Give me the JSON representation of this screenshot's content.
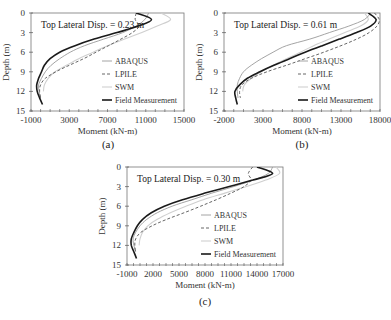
{
  "chart_data": [
    {
      "id": "a",
      "type": "line",
      "caption": "(a)",
      "title": "",
      "annotation": "Top Lateral Disp. = 0.23 m",
      "xlabel": "Moment (kN-m)",
      "ylabel": "Depth (m)",
      "xlim": [
        -1000,
        15000
      ],
      "ylim": [
        0,
        15
      ],
      "y_inverted": true,
      "xticks": [
        -1000,
        3000,
        7000,
        11000,
        15000
      ],
      "xtick_labels": [
        "-1000",
        "3000",
        "7000",
        "11000",
        "15000"
      ],
      "yticks": [
        0,
        3,
        6,
        9,
        12,
        15
      ],
      "yticks_labels": [
        "0",
        "3",
        "6",
        "9",
        "12",
        "15"
      ],
      "grid": false,
      "legend_position": "lower right",
      "series": [
        {
          "name": "ABAQUS",
          "style": "thin-gray",
          "depth": [
            0,
            1,
            2,
            3,
            4,
            5,
            6,
            7,
            8,
            9,
            10,
            11,
            12,
            13
          ],
          "moment": [
            11300,
            10900,
            10000,
            8600,
            6600,
            4600,
            3100,
            2000,
            1100,
            500,
            100,
            -200,
            -150,
            0
          ]
        },
        {
          "name": "LPILE",
          "style": "dashed",
          "depth": [
            0,
            1,
            2,
            3,
            4,
            5,
            6,
            7,
            8,
            9,
            10,
            11,
            12,
            13
          ],
          "moment": [
            10000,
            9900,
            10300,
            9600,
            8400,
            7100,
            5800,
            4500,
            3000,
            1600,
            500,
            0,
            -100,
            0
          ]
        },
        {
          "name": "SWM",
          "style": "light-gray",
          "depth": [
            0,
            1,
            2,
            3,
            4,
            5,
            6,
            7,
            8,
            9,
            10,
            11,
            12
          ],
          "moment": [
            12600,
            13600,
            12200,
            10600,
            8800,
            7000,
            5500,
            4000,
            2700,
            1500,
            800,
            400,
            300
          ]
        },
        {
          "name": "Field Measurement",
          "style": "thick-black",
          "depth": [
            0,
            1,
            2,
            3,
            4,
            5,
            6,
            7,
            8,
            9,
            10,
            11,
            12,
            13,
            14
          ],
          "moment": [
            10000,
            11600,
            10200,
            8000,
            5600,
            3600,
            2000,
            1000,
            400,
            100,
            -200,
            -400,
            -350,
            -100,
            200
          ]
        }
      ]
    },
    {
      "id": "b",
      "type": "line",
      "caption": "(b)",
      "title": "",
      "annotation": "Top Lateral Disp. = 0.61 m",
      "xlabel": "Moment (kN-m)",
      "ylabel": "Depth (m)",
      "xlim": [
        -2000,
        18000
      ],
      "ylim": [
        0,
        15
      ],
      "y_inverted": true,
      "xticks": [
        -2000,
        3000,
        8000,
        13000,
        18000
      ],
      "xtick_labels": [
        "-2000",
        "3000",
        "8000",
        "13000",
        "18000"
      ],
      "yticks": [
        0,
        3,
        6,
        9,
        12,
        15
      ],
      "yticks_labels": [
        "0",
        "3",
        "6",
        "9",
        "12",
        "15"
      ],
      "grid": false,
      "legend_position": "lower right",
      "series": [
        {
          "name": "ABAQUS",
          "style": "thin-gray",
          "depth": [
            0,
            1,
            2,
            3,
            4,
            5,
            6,
            7,
            8,
            9,
            10,
            11,
            12,
            13
          ],
          "moment": [
            16800,
            16000,
            14000,
            11500,
            9000,
            6000,
            4300,
            2800,
            1500,
            500,
            0,
            -300,
            -300,
            -200
          ]
        },
        {
          "name": "LPILE",
          "style": "dashed",
          "depth": [
            0,
            1,
            2,
            3,
            4,
            5,
            6,
            7,
            8,
            9,
            10,
            11,
            12,
            13
          ],
          "moment": [
            17300,
            17900,
            17600,
            16600,
            15000,
            13000,
            10800,
            8400,
            6000,
            3500,
            1500,
            300,
            0,
            100
          ]
        },
        {
          "name": "SWM",
          "style": "light-gray",
          "depth": [
            0,
            1,
            2,
            3,
            4,
            5,
            6,
            7,
            8,
            9,
            10,
            11,
            12
          ],
          "moment": [
            16000,
            16500,
            15500,
            13500,
            11500,
            9500,
            7800,
            6000,
            4300,
            2800,
            1500,
            600,
            400
          ]
        },
        {
          "name": "Field Measurement",
          "style": "thick-black",
          "depth": [
            0,
            1,
            2,
            3,
            4,
            5,
            6,
            7,
            8,
            9,
            10,
            11,
            12,
            13,
            14
          ],
          "moment": [
            16500,
            17500,
            16800,
            15000,
            12800,
            10600,
            8400,
            6400,
            4400,
            2600,
            1000,
            0,
            -600,
            -500,
            -300
          ]
        }
      ]
    },
    {
      "id": "c",
      "type": "line",
      "caption": "(c)",
      "title": "",
      "annotation": "Top Lateral Disp. = 0.30 m",
      "xlabel": "Moment (kN-m)",
      "ylabel": "Depth (m)",
      "xlim": [
        -1000,
        17000
      ],
      "ylim": [
        0,
        15
      ],
      "y_inverted": true,
      "xticks": [
        -1000,
        2000,
        5000,
        8000,
        11000,
        14000,
        17000
      ],
      "xtick_labels": [
        "-1000",
        "2000",
        "5000",
        "8000",
        "11000",
        "14000",
        "17000"
      ],
      "yticks": [
        0,
        3,
        6,
        9,
        12,
        15
      ],
      "yticks_labels": [
        "0",
        "3",
        "6",
        "9",
        "12",
        "15"
      ],
      "grid": false,
      "legend_position": "lower right",
      "series": [
        {
          "name": "ABAQUS",
          "style": "thin-gray",
          "depth": [
            0,
            1,
            2,
            3,
            4,
            5,
            6,
            7,
            8,
            9,
            10,
            11,
            12,
            13
          ],
          "moment": [
            15800,
            15300,
            13600,
            11300,
            8800,
            6500,
            4200,
            2500,
            1300,
            500,
            0,
            -300,
            -200,
            0
          ]
        },
        {
          "name": "LPILE",
          "style": "dashed",
          "depth": [
            0,
            1,
            2,
            3,
            4,
            5,
            6,
            7,
            8,
            9,
            10,
            11,
            12,
            13
          ],
          "moment": [
            13500,
            13000,
            13300,
            12500,
            11000,
            9300,
            7500,
            5600,
            3600,
            1900,
            600,
            0,
            -100,
            0
          ]
        },
        {
          "name": "SWM",
          "style": "light-gray",
          "depth": [
            0,
            1,
            2,
            3,
            4,
            5,
            6,
            7,
            8,
            9,
            10,
            11,
            12
          ],
          "moment": [
            16200,
            16600,
            15000,
            12800,
            10300,
            7800,
            5800,
            4000,
            2500,
            1400,
            800,
            500,
            400
          ]
        },
        {
          "name": "Field Measurement",
          "style": "thick-black",
          "depth": [
            0,
            1,
            2,
            3,
            4,
            5,
            6,
            7,
            8,
            9,
            10,
            11,
            12,
            13,
            14
          ],
          "moment": [
            14000,
            15800,
            13500,
            10800,
            8000,
            5400,
            3300,
            1800,
            800,
            200,
            -200,
            -500,
            -500,
            -200,
            100
          ]
        }
      ]
    }
  ],
  "figure": {
    "legend_labels": [
      "ABAQUS",
      "LPILE",
      "SWM",
      "Field Measurement"
    ]
  }
}
